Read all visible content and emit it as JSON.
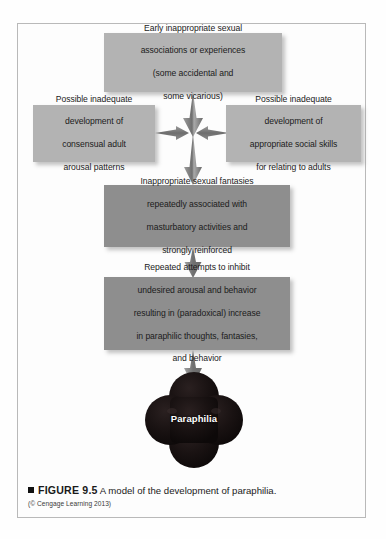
{
  "figure": {
    "frame_border_color": "#b9b9b9",
    "background_color": "#fefefe"
  },
  "diagram": {
    "type": "flowchart",
    "title": "A model of the development of paraphilia",
    "box_light_color": "#b3b3b3",
    "box_dark_color": "#8e8e8e",
    "arrow_color": "#7a7a7a",
    "terminal_color": "#1a1212",
    "boxes": [
      {
        "id": "box-top",
        "shade": "light",
        "lines": [
          "Early inappropriate sexual",
          "associations or experiences",
          "(some accidental and",
          "some vicarious)"
        ]
      },
      {
        "id": "box-left",
        "shade": "light",
        "lines": [
          "Possible inadequate",
          "development of",
          "consensual adult",
          "arousal patterns"
        ]
      },
      {
        "id": "box-right",
        "shade": "light",
        "lines": [
          "Possible inadequate",
          "development of",
          "appropriate social skills",
          "for relating to adults"
        ]
      },
      {
        "id": "box-mid",
        "shade": "dark",
        "lines": [
          "Inappropriate sexual fantasies",
          "repeatedly associated with",
          "masturbatory activities and",
          "strongly reinforced"
        ]
      },
      {
        "id": "box-fourth",
        "shade": "dark",
        "lines": [
          "Repeated attempts to inhibit",
          "undesired arousal and behavior",
          "resulting in (paradoxical) increase",
          "in paraphilic thoughts, fantasies,",
          "and behavior"
        ]
      }
    ],
    "terminal_node": {
      "label": "Paraphilia",
      "shape": "four-lobed-clover"
    },
    "arrows": [
      {
        "name": "top-to-center",
        "direction": "down"
      },
      {
        "name": "left-to-center",
        "direction": "right"
      },
      {
        "name": "right-to-center",
        "direction": "left"
      },
      {
        "name": "center-to-mid-box",
        "direction": "down"
      },
      {
        "name": "mid-box-to-fourth-box",
        "direction": "down"
      },
      {
        "name": "fourth-box-to-paraphilia",
        "direction": "down"
      }
    ]
  },
  "caption": {
    "bullet": "square-bullet",
    "figure_label": "FIGURE 9.5",
    "text": "A model of the development of paraphilia.",
    "credit": "(© Cengage Learning 2013)"
  }
}
